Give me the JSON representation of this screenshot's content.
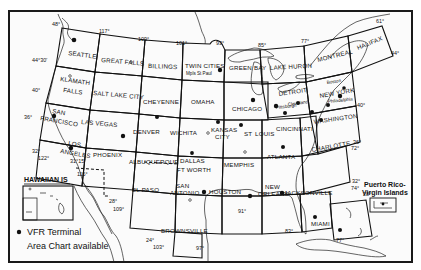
{
  "map": {
    "title": "VFR Sectional Aeronautical Charts Index",
    "sectional_charts": [
      {
        "name": "SEATTLE"
      },
      {
        "name": "GREAT FALLS"
      },
      {
        "name": "BILLINGS"
      },
      {
        "name": "TWIN CITIES",
        "sub": "Mpls St Paul"
      },
      {
        "name": "GREEN BAY"
      },
      {
        "name": "LAKE HURON"
      },
      {
        "name": "MONTREAL"
      },
      {
        "name": "HALIFAX"
      },
      {
        "name": "KLAMATH FALLS"
      },
      {
        "name": "SALT LAKE CITY"
      },
      {
        "name": "CHEYENNE"
      },
      {
        "name": "OMAHA"
      },
      {
        "name": "CHICAGO"
      },
      {
        "name": "DETROIT",
        "sub": "Cleveland"
      },
      {
        "name": "NEW YORK",
        "sub": "Boston"
      },
      {
        "name": "SAN FRANCISCO"
      },
      {
        "name": "LAS VEGAS"
      },
      {
        "name": "DENVER"
      },
      {
        "name": "WICHITA"
      },
      {
        "name": "KANSAS CITY"
      },
      {
        "name": "ST LOUIS"
      },
      {
        "name": "CINCINNATI",
        "sub": "Pittsburgh"
      },
      {
        "name": "WASHINGTON",
        "sub": "Philadelphia"
      },
      {
        "name": "LOS ANGELES"
      },
      {
        "name": "PHOENIX"
      },
      {
        "name": "ALBUQUERQUE"
      },
      {
        "name": "DALLAS FT WORTH"
      },
      {
        "name": "MEMPHIS"
      },
      {
        "name": "ATLANTA"
      },
      {
        "name": "CHARLOTTE"
      },
      {
        "name": "EL PASO"
      },
      {
        "name": "SAN ANTONIO"
      },
      {
        "name": "HOUSTON"
      },
      {
        "name": "NEW ORLEANS"
      },
      {
        "name": "JACKSONVILLE"
      },
      {
        "name": "BROWNSVILLE"
      },
      {
        "name": "MIAMI"
      }
    ],
    "labels": {
      "seattle": "SEATTLE",
      "great_falls": "GREAT FALLS",
      "billings": "BILLINGS",
      "twin_cities": "TWIN CITIES",
      "mpls": "Mpls St Paul",
      "green_bay": "GREEN BAY",
      "lake_huron": "LAKE HURON",
      "montreal": "MONTREAL",
      "halifax": "HALIFAX",
      "klamath": "KLAMATH",
      "falls": "FALLS",
      "salt_lake": "SALT LAKE CITY",
      "cheyenne": "CHEYENNE",
      "omaha": "OMAHA",
      "chicago": "CHICAGO",
      "detroit": "DETROIT",
      "cleveland": "Cleveland",
      "boston": "Boston",
      "new_york": "NEW YORK",
      "san": "SAN",
      "francisco": "FRANCISCO",
      "las_vegas": "LAS VEGAS",
      "denver": "DENVER",
      "wichita": "WICHITA",
      "kansas": "KANSAS",
      "city": "CITY",
      "st": "ST",
      "louis": "LOUIS",
      "cincinnati": "CINCINNATI",
      "pittsburgh": "Pittsburgh",
      "philadelphia": "Philadelphia",
      "washington": "WASHINGTON",
      "los": "LOS",
      "angeles": "ANGELES",
      "phoenix": "PHOENIX",
      "albuquerque": "ALBUQUERQUE",
      "dallas": "DALLAS",
      "ft_worth": "FT WORTH",
      "memphis": "MEMPHIS",
      "atlanta": "ATLANTA",
      "charlotte": "CHARLOTTE",
      "el_paso": "EL PASO",
      "san_antonio_1": "SAN",
      "san_antonio_2": "ANTONIO",
      "houston": "HOUSTON",
      "new": "NEW",
      "orleans": "ORLEANS",
      "jacksonville": "JACKSONVILLE",
      "brownsville": "BROWNSVILLE",
      "miami": "MIAMI"
    },
    "degree_marks": {
      "d117": "117°",
      "d109": "109°",
      "d101": "101°",
      "d93": "93°",
      "d85": "85°",
      "d77": "77°",
      "d61": "61°",
      "d44": "44°",
      "d48": "48°",
      "d44_30": "44°30'",
      "d40w": "40°",
      "d36w": "36°",
      "d32w": "32°",
      "d122": "122°",
      "d31_15": "31°15'",
      "d115": "115°",
      "d28w": "28°",
      "d109b": "109°",
      "d24": "24°",
      "d103": "103°",
      "d97": "97°",
      "d91": "91°",
      "d83": "83°",
      "d28e": "28°",
      "d77b": "77°",
      "d32e": "32°",
      "d74": "74°",
      "d36e": "36°",
      "d72": "72°",
      "d40e": "40°"
    },
    "insets": {
      "hawaii": "HAWAIIAN IS",
      "puerto_rico_1": "Puerto Rico-",
      "puerto_rico_2": "Virgin Islands"
    },
    "legend": {
      "line1": "VFR Terminal",
      "line2": "Area Chart available",
      "symbol": "filled-dot"
    },
    "colors": {
      "ink": "#111111",
      "paper": "#fbfbfb"
    }
  }
}
